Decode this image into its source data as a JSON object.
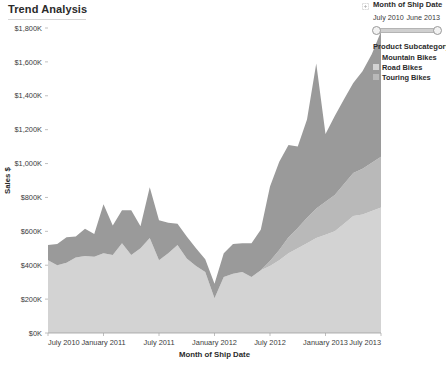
{
  "title": "Trend Analysis",
  "filter": {
    "icon": "collapse-icon",
    "title": "Month of Ship Date",
    "range_start": "July 2010",
    "range_end": "June 2013"
  },
  "legend": {
    "title": "Product Subcategory",
    "items": [
      {
        "label": "Mountain Bikes",
        "color": "#9a9a9a"
      },
      {
        "label": "Road Bikes",
        "color": "#d3d3d3"
      },
      {
        "label": "Touring Bikes",
        "color": "#b9b9b9"
      }
    ]
  },
  "chart_data": {
    "type": "area",
    "stacked": true,
    "title": "Trend Analysis",
    "xlabel": "Month of Ship Date",
    "ylabel": "Sales $",
    "ylim": [
      0,
      1800000
    ],
    "ytick_values": [
      0,
      200000,
      400000,
      600000,
      800000,
      1000000,
      1200000,
      1400000,
      1600000,
      1800000
    ],
    "ytick_labels": [
      "$0K",
      "$200K",
      "$400K",
      "$600K",
      "$800K",
      "$1,000K",
      "$1,200K",
      "$1,400K",
      "$1,600K",
      "$1,800K"
    ],
    "xtick_labels": [
      "July 2010",
      "January 2011",
      "July 2011",
      "January 2012",
      "July 2012",
      "January 2013",
      "July 2013"
    ],
    "xtick_index": [
      0,
      6,
      12,
      18,
      24,
      30,
      36
    ],
    "grid": false,
    "legend_position": "right",
    "x": [
      "July 2010",
      "August 2010",
      "September 2010",
      "October 2010",
      "November 2010",
      "December 2010",
      "January 2011",
      "February 2011",
      "March 2011",
      "April 2011",
      "May 2011",
      "June 2011",
      "July 2011",
      "August 2011",
      "September 2011",
      "October 2011",
      "November 2011",
      "December 2011",
      "January 2012",
      "February 2012",
      "March 2012",
      "April 2012",
      "May 2012",
      "June 2012",
      "July 2012",
      "August 2012",
      "September 2012",
      "October 2012",
      "November 2012",
      "December 2012",
      "January 2013",
      "February 2013",
      "March 2013",
      "April 2013",
      "May 2013",
      "June 2013",
      "July 2013"
    ],
    "series": [
      {
        "name": "Road Bikes",
        "color": "#d3d3d3",
        "values": [
          430000,
          400000,
          415000,
          445000,
          455000,
          450000,
          470000,
          460000,
          530000,
          460000,
          500000,
          560000,
          430000,
          470000,
          520000,
          440000,
          395000,
          360000,
          205000,
          330000,
          350000,
          360000,
          330000,
          370000,
          395000,
          430000,
          470000,
          500000,
          530000,
          560000,
          580000,
          600000,
          645000,
          690000,
          700000,
          720000,
          740000
        ]
      },
      {
        "name": "Touring Bikes",
        "color": "#b9b9b9",
        "values": [
          0,
          0,
          0,
          0,
          0,
          0,
          0,
          0,
          0,
          0,
          0,
          0,
          0,
          0,
          0,
          0,
          0,
          0,
          0,
          0,
          0,
          0,
          0,
          0,
          30000,
          60000,
          95000,
          120000,
          150000,
          175000,
          195000,
          215000,
          235000,
          255000,
          270000,
          285000,
          300000
        ]
      },
      {
        "name": "Mountain Bikes",
        "color": "#9a9a9a",
        "values": [
          90000,
          125000,
          150000,
          125000,
          160000,
          135000,
          290000,
          175000,
          195000,
          265000,
          130000,
          300000,
          235000,
          180000,
          125000,
          130000,
          105000,
          75000,
          85000,
          140000,
          175000,
          170000,
          200000,
          240000,
          440000,
          520000,
          545000,
          480000,
          580000,
          855000,
          400000,
          465000,
          500000,
          530000,
          575000,
          640000,
          740000
        ]
      }
    ]
  }
}
